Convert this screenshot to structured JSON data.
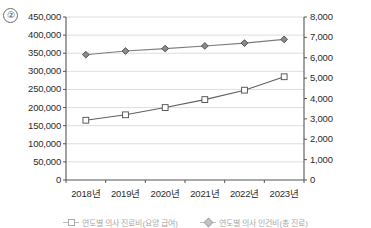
{
  "item_number": "②",
  "chart_data": {
    "type": "line",
    "title": "",
    "xlabel": "",
    "ylabel": "",
    "categories": [
      "2018년",
      "2019년",
      "2020년",
      "2021년",
      "2022년",
      "2023년"
    ],
    "grid": true,
    "legend_position": "bottom",
    "axes": {
      "left": {
        "ticks": [
          "0",
          "50,000",
          "100,000",
          "150,000",
          "200,000",
          "250,000",
          "300,000",
          "350,000",
          "400,000",
          "450,000"
        ],
        "values": [
          0,
          50000,
          100000,
          150000,
          200000,
          250000,
          300000,
          350000,
          400000,
          450000
        ],
        "min": 0,
        "max": 450000,
        "step": 50000
      },
      "right": {
        "ticks": [
          "0",
          "1,000",
          "2,000",
          "3,000",
          "4,000",
          "5,000",
          "6,000",
          "7,000",
          "8,000"
        ],
        "values": [
          0,
          1000,
          2000,
          3000,
          4000,
          5000,
          6000,
          7000,
          8000
        ],
        "min": 0,
        "max": 8000,
        "step": 1000
      }
    },
    "series": [
      {
        "name": "연도별 의사 인건비(총 진료비)",
        "marker": "square",
        "axis": "left",
        "color": "#5f5f5f",
        "fill": "#ffffff",
        "values": [
          165000,
          180000,
          200000,
          222000,
          248000,
          285000
        ]
      },
      {
        "name": "연도별 의사 인건비(총 진료비)",
        "marker": "diamond",
        "axis": "right",
        "color": "#7d7d7d",
        "fill": "#8a8a8a",
        "values": [
          6150,
          6330,
          6450,
          6580,
          6720,
          6900
        ]
      }
    ],
    "colors": {
      "axis": "#555555",
      "grid": "#d5d5d5",
      "plot_bg": "#ffffff",
      "text": "#2b2b2b"
    }
  },
  "legend": [
    {
      "label": "연도별 의사 진료비(요양 급여)",
      "marker": "square"
    },
    {
      "label": "연도별 의사 인건비(총 진료)",
      "marker": "diamond"
    }
  ]
}
